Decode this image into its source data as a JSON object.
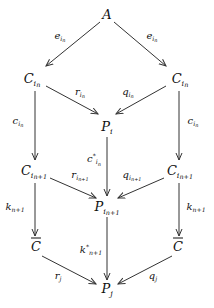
{
  "diagram": {
    "type": "commutative-diagram",
    "nodes": [
      {
        "id": "A",
        "base": "A",
        "sub": "",
        "subsub": "",
        "sup": "",
        "over": false,
        "x": 107,
        "y": 14
      },
      {
        "id": "C_in_left",
        "base": "C",
        "sub": "i",
        "subsub": "n",
        "sup": "",
        "over": false,
        "x": 32,
        "y": 80
      },
      {
        "id": "C_in_right",
        "base": "C",
        "sub": "i",
        "subsub": "n",
        "sup": "",
        "over": false,
        "x": 180,
        "y": 80
      },
      {
        "id": "P_i",
        "base": "P",
        "sub": "i",
        "subsub": "",
        "sup": "",
        "over": false,
        "x": 107,
        "y": 128
      },
      {
        "id": "C_in1_left",
        "base": "C",
        "sub": "i",
        "subsub": "n+1",
        "sup": "",
        "over": false,
        "x": 34,
        "y": 172
      },
      {
        "id": "C_in1_right",
        "base": "C",
        "sub": "i",
        "subsub": "n+1",
        "sup": "",
        "over": false,
        "x": 180,
        "y": 172
      },
      {
        "id": "P_in1",
        "base": "P",
        "sub": "i",
        "subsub": "n+1",
        "sup": "",
        "over": false,
        "x": 107,
        "y": 208
      },
      {
        "id": "Cbar_left",
        "base": "C",
        "sub": "",
        "subsub": "",
        "sup": "",
        "over": true,
        "x": 36,
        "y": 246
      },
      {
        "id": "Cbar_right",
        "base": "C",
        "sub": "",
        "subsub": "",
        "sup": "",
        "over": true,
        "x": 178,
        "y": 246
      },
      {
        "id": "P_j",
        "base": "P",
        "sub": "j",
        "subsub": "",
        "sup": "",
        "over": false,
        "x": 107,
        "y": 290
      }
    ],
    "edges": [
      {
        "from": "A",
        "to": "C_in_left",
        "label": {
          "base": "e",
          "sub": "i",
          "subsub": "n",
          "sup": ""
        },
        "x1": 100,
        "y1": 22,
        "x2": 46,
        "y2": 66,
        "lx": 60,
        "ly": 37
      },
      {
        "from": "A",
        "to": "C_in_right",
        "label": {
          "base": "e",
          "sub": "i",
          "subsub": "n",
          "sup": ""
        },
        "x1": 114,
        "y1": 22,
        "x2": 166,
        "y2": 66,
        "lx": 152,
        "ly": 37
      },
      {
        "from": "C_in_left",
        "to": "P_i",
        "label": {
          "base": "r",
          "sub": "i",
          "subsub": "n",
          "sup": ""
        },
        "x1": 46,
        "y1": 86,
        "x2": 98,
        "y2": 114,
        "lx": 80,
        "ly": 93
      },
      {
        "from": "C_in_right",
        "to": "P_i",
        "label": {
          "base": "q",
          "sub": "i",
          "subsub": "n",
          "sup": ""
        },
        "x1": 166,
        "y1": 86,
        "x2": 116,
        "y2": 114,
        "lx": 128,
        "ly": 93
      },
      {
        "from": "C_in_left",
        "to": "C_in1_left",
        "label": {
          "base": "c",
          "sub": "i",
          "subsub": "n",
          "sup": ""
        },
        "x1": 35,
        "y1": 91,
        "x2": 35,
        "y2": 160,
        "lx": 18,
        "ly": 122
      },
      {
        "from": "C_in_right",
        "to": "C_in1_right",
        "label": {
          "base": "c",
          "sub": "i",
          "subsub": "n",
          "sup": ""
        },
        "x1": 179,
        "y1": 91,
        "x2": 179,
        "y2": 160,
        "lx": 193,
        "ly": 122
      },
      {
        "from": "P_i",
        "to": "P_in1",
        "label": {
          "base": "c",
          "sub": "i",
          "subsub": "n",
          "sup": "*"
        },
        "x1": 107,
        "y1": 137,
        "x2": 107,
        "y2": 196,
        "lx": 94,
        "ly": 160
      },
      {
        "from": "C_in1_left",
        "to": "P_in1",
        "label": {
          "base": "r",
          "sub": "i",
          "subsub": "n+1",
          "sup": ""
        },
        "x1": 50,
        "y1": 178,
        "x2": 96,
        "y2": 198,
        "lx": 80,
        "ly": 176
      },
      {
        "from": "C_in1_right",
        "to": "P_in1",
        "label": {
          "base": "q",
          "sub": "i",
          "subsub": "n+1",
          "sup": ""
        },
        "x1": 164,
        "y1": 178,
        "x2": 118,
        "y2": 198,
        "lx": 132,
        "ly": 176
      },
      {
        "from": "C_in1_left",
        "to": "Cbar_left",
        "label": {
          "base": "k",
          "sub": "n+1",
          "subsub": "",
          "sup": ""
        },
        "x1": 35,
        "y1": 183,
        "x2": 35,
        "y2": 236,
        "lx": 15,
        "ly": 208
      },
      {
        "from": "C_in1_right",
        "to": "Cbar_right",
        "label": {
          "base": "k",
          "sub": "n+1",
          "subsub": "",
          "sup": ""
        },
        "x1": 179,
        "y1": 183,
        "x2": 179,
        "y2": 236,
        "lx": 196,
        "ly": 208
      },
      {
        "from": "P_in1",
        "to": "P_j",
        "label": {
          "base": "k",
          "sub": "n+1",
          "subsub": "",
          "sup": "*"
        },
        "x1": 107,
        "y1": 217,
        "x2": 107,
        "y2": 280,
        "lx": 91,
        "ly": 250
      },
      {
        "from": "Cbar_left",
        "to": "P_j",
        "label": {
          "base": "r",
          "sub": "j",
          "subsub": "",
          "sup": ""
        },
        "x1": 42,
        "y1": 256,
        "x2": 96,
        "y2": 284,
        "lx": 58,
        "ly": 277
      },
      {
        "from": "Cbar_right",
        "to": "P_j",
        "label": {
          "base": "q",
          "sub": "j",
          "subsub": "",
          "sup": ""
        },
        "x1": 172,
        "y1": 256,
        "x2": 118,
        "y2": 284,
        "lx": 153,
        "ly": 277
      }
    ],
    "colors": {
      "stroke": "#333333",
      "text": "#111111",
      "background": "#ffffff"
    }
  }
}
